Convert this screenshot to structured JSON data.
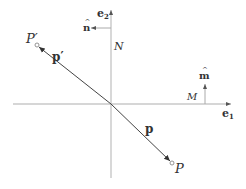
{
  "diagram": {
    "colors": {
      "axis": "#c8c8c8",
      "vector": "#444444",
      "text": "#333333",
      "point": "#888888"
    },
    "axes": {
      "e1": {
        "label": "e",
        "subscript": "1"
      },
      "e2": {
        "label": "e",
        "subscript": "2"
      }
    },
    "lines": {
      "N": {
        "label": "N"
      },
      "M": {
        "label": "M"
      }
    },
    "normals": {
      "n_hat": {
        "label": "n",
        "hat": "^"
      },
      "m_hat": {
        "label": "m",
        "hat": "^"
      }
    },
    "points": {
      "P": {
        "label": "P"
      },
      "P_prime": {
        "label": "P′"
      }
    },
    "vectors": {
      "p": {
        "label": "p"
      },
      "p_prime": {
        "label": "p′"
      }
    }
  }
}
